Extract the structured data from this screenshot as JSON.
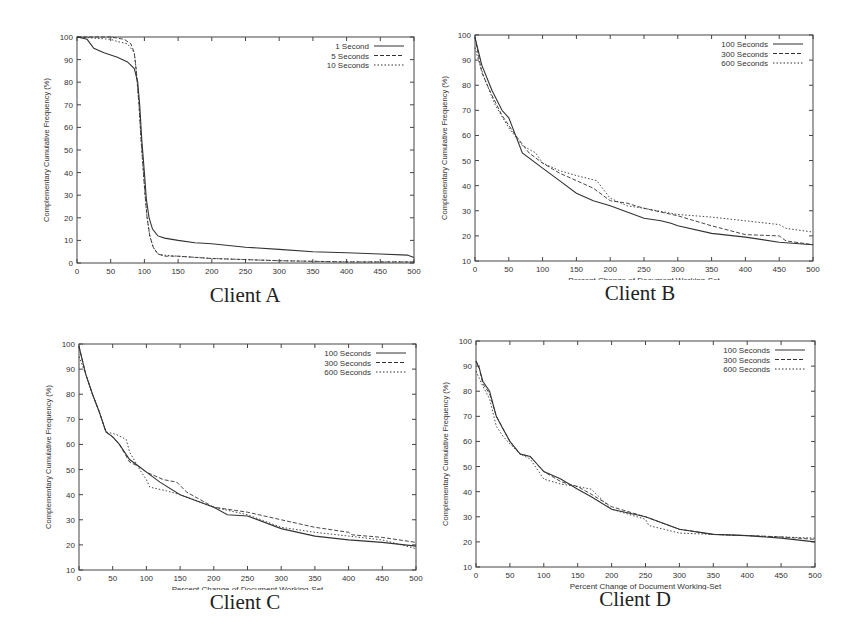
{
  "figure": {
    "captions": [
      "Client A",
      "Client B",
      "Client C",
      "Client D"
    ]
  },
  "chart_data": [
    {
      "type": "line",
      "title": "Client A",
      "xlabel": "Percent Change of Document Working-Set",
      "ylabel": "Complementary Cumulative Frequency (%)",
      "xlim": [
        0,
        500
      ],
      "ylim": [
        0,
        100
      ],
      "xticks": [
        0,
        50,
        100,
        150,
        200,
        250,
        300,
        350,
        400,
        450,
        500
      ],
      "yticks": [
        0,
        10,
        20,
        30,
        40,
        50,
        60,
        70,
        80,
        90,
        100
      ],
      "grid": false,
      "legend_position": "top-right",
      "series": [
        {
          "name": "1 Second",
          "style": "solid",
          "x": [
            0,
            15,
            25,
            40,
            60,
            75,
            85,
            90,
            93,
            96,
            100,
            103,
            107,
            112,
            120,
            130,
            150,
            175,
            200,
            250,
            300,
            350,
            400,
            450,
            490,
            500
          ],
          "y": [
            100,
            99,
            95,
            93,
            91,
            89,
            86,
            80,
            70,
            55,
            40,
            28,
            20,
            15,
            12,
            11,
            10,
            9,
            8.5,
            7,
            6,
            5,
            4.5,
            4,
            3.5,
            2.5
          ]
        },
        {
          "name": "5 Seconds",
          "style": "dashed",
          "x": [
            0,
            50,
            70,
            80,
            85,
            88,
            92,
            95,
            98,
            101,
            104,
            108,
            113,
            120,
            130,
            150,
            200,
            250,
            300,
            400,
            500
          ],
          "y": [
            100,
            100,
            99,
            97,
            93,
            85,
            70,
            55,
            42,
            30,
            20,
            12,
            7,
            4,
            3,
            3,
            2,
            1.5,
            1,
            0.5,
            0.5
          ]
        },
        {
          "name": "10 Seconds",
          "style": "dotted",
          "x": [
            0,
            50,
            60,
            75,
            85,
            88,
            92,
            95,
            98,
            101,
            104,
            108,
            113,
            120,
            130,
            150,
            200,
            250,
            300,
            400,
            500
          ],
          "y": [
            100,
            99,
            98,
            97,
            93,
            85,
            70,
            55,
            42,
            30,
            20,
            12,
            7,
            4,
            3.5,
            3,
            2,
            1.5,
            1,
            0.5,
            0.5
          ]
        }
      ]
    },
    {
      "type": "line",
      "title": "Client B",
      "xlabel": "Percent Change of Document Working-Set",
      "ylabel": "Complementary Cumulative Frequency (%)",
      "xlim": [
        0,
        500
      ],
      "ylim": [
        10,
        100
      ],
      "xticks": [
        0,
        50,
        100,
        150,
        200,
        250,
        300,
        350,
        400,
        450,
        500
      ],
      "yticks": [
        10,
        20,
        30,
        40,
        50,
        60,
        70,
        80,
        90,
        100
      ],
      "grid": false,
      "legend_position": "top-right",
      "series": [
        {
          "name": "100 Seconds",
          "style": "solid",
          "x": [
            0,
            10,
            25,
            40,
            50,
            60,
            70,
            100,
            125,
            150,
            175,
            200,
            250,
            275,
            290,
            300,
            350,
            400,
            450,
            500
          ],
          "y": [
            99,
            88,
            78,
            70,
            67,
            60,
            53,
            47,
            42,
            37,
            34,
            32,
            27,
            26,
            25,
            24,
            21,
            19.5,
            17.5,
            16.5
          ]
        },
        {
          "name": "300 Seconds",
          "style": "dashed",
          "x": [
            0,
            10,
            25,
            40,
            60,
            80,
            100,
            125,
            150,
            175,
            200,
            225,
            250,
            300,
            350,
            400,
            450,
            460,
            500
          ],
          "y": [
            99,
            85,
            76,
            68,
            60,
            53,
            49,
            45,
            42,
            39,
            34,
            33,
            31,
            28,
            24,
            20.5,
            20,
            18,
            16.5
          ]
        },
        {
          "name": "600 Seconds",
          "style": "dotted",
          "x": [
            0,
            5,
            15,
            30,
            50,
            70,
            90,
            100,
            125,
            150,
            180,
            200,
            225,
            250,
            300,
            350,
            400,
            450,
            460,
            500
          ],
          "y": [
            95,
            90,
            82,
            72,
            63,
            56,
            53,
            49,
            46,
            44,
            42,
            35,
            32,
            31,
            28.5,
            27.5,
            26,
            24.5,
            23,
            21.5
          ]
        }
      ]
    },
    {
      "type": "line",
      "title": "Client C",
      "xlabel": "Percent Change of Document Working-Set",
      "ylabel": "Complementary Cumulative Frequency (%)",
      "xlim": [
        0,
        500
      ],
      "ylim": [
        10,
        100
      ],
      "xticks": [
        0,
        50,
        100,
        150,
        200,
        250,
        300,
        350,
        400,
        450,
        500
      ],
      "yticks": [
        10,
        20,
        30,
        40,
        50,
        60,
        70,
        80,
        90,
        100
      ],
      "grid": false,
      "legend_position": "top-right",
      "series": [
        {
          "name": "100 Seconds",
          "style": "solid",
          "x": [
            0,
            10,
            20,
            30,
            40,
            50,
            60,
            75,
            90,
            100,
            120,
            150,
            180,
            200,
            220,
            250,
            300,
            350,
            400,
            450,
            500
          ],
          "y": [
            99,
            88,
            80,
            73,
            65,
            63,
            60,
            54,
            51,
            49,
            45,
            40,
            37,
            35,
            32,
            31.5,
            26.5,
            23.5,
            22,
            21,
            19.5
          ]
        },
        {
          "name": "300 Seconds",
          "style": "dashed",
          "x": [
            0,
            10,
            20,
            30,
            40,
            50,
            60,
            75,
            90,
            100,
            125,
            145,
            160,
            200,
            250,
            300,
            350,
            400,
            405,
            450,
            500
          ],
          "y": [
            99,
            88,
            80,
            73,
            65,
            63,
            60,
            53,
            51,
            49,
            46,
            45,
            41,
            35,
            33,
            30,
            27,
            25,
            24,
            23,
            21
          ]
        },
        {
          "name": "600 Seconds",
          "style": "dotted",
          "x": [
            0,
            10,
            20,
            30,
            40,
            55,
            70,
            75,
            90,
            100,
            105,
            130,
            150,
            200,
            250,
            300,
            350,
            400,
            450,
            500
          ],
          "y": [
            95,
            88,
            80,
            73,
            65,
            64,
            62,
            57,
            50,
            46,
            43,
            41.5,
            40,
            35,
            32,
            27,
            25,
            23.5,
            22,
            18.5
          ]
        }
      ]
    },
    {
      "type": "line",
      "title": "Client D",
      "xlabel": "Percent Change of Document Working-Set",
      "ylabel": "Complementary Cumulative Frequency (%)",
      "xlim": [
        0,
        500
      ],
      "ylim": [
        10,
        100
      ],
      "xticks": [
        0,
        50,
        100,
        150,
        200,
        250,
        300,
        350,
        400,
        450,
        500
      ],
      "yticks": [
        10,
        20,
        30,
        40,
        50,
        60,
        70,
        80,
        90,
        100
      ],
      "grid": false,
      "legend_position": "top-right",
      "series": [
        {
          "name": "100 Seconds",
          "style": "solid",
          "x": [
            0,
            5,
            10,
            20,
            30,
            40,
            50,
            65,
            80,
            90,
            100,
            125,
            150,
            170,
            200,
            250,
            300,
            350,
            400,
            450,
            500
          ],
          "y": [
            92,
            89,
            84,
            80,
            70,
            65,
            60,
            55,
            54,
            51,
            48,
            45,
            41,
            38,
            33,
            30,
            25,
            23,
            22.5,
            21.5,
            20
          ]
        },
        {
          "name": "300 Seconds",
          "style": "dashed",
          "x": [
            0,
            5,
            10,
            20,
            30,
            40,
            50,
            65,
            80,
            90,
            100,
            125,
            150,
            170,
            200,
            250,
            300,
            350,
            400,
            450,
            500
          ],
          "y": [
            92,
            89,
            83,
            79,
            70,
            65,
            60,
            55,
            54,
            51,
            48,
            44,
            42,
            39,
            34,
            30,
            25,
            23,
            22.5,
            22,
            21
          ]
        },
        {
          "name": "600 Seconds",
          "style": "dotted",
          "x": [
            0,
            5,
            10,
            20,
            30,
            40,
            50,
            65,
            80,
            90,
            100,
            125,
            150,
            170,
            200,
            250,
            255,
            300,
            350,
            400,
            450,
            500
          ],
          "y": [
            88,
            85,
            82,
            77,
            66,
            62,
            59,
            55,
            53,
            49,
            45,
            43,
            42,
            41,
            33,
            29,
            26.5,
            23.5,
            23,
            22.5,
            22,
            21.5
          ]
        }
      ]
    }
  ]
}
